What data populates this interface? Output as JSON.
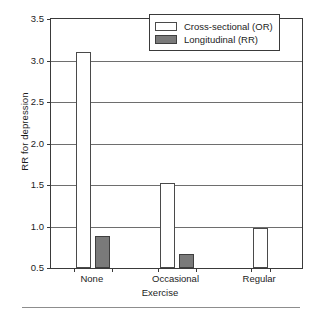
{
  "chart_data": {
    "type": "bar",
    "title": "",
    "subtitle": "",
    "xlabel": "Exercise",
    "ylabel": "RR for depression",
    "categories": [
      "None",
      "Occasional",
      "Regular"
    ],
    "ylim": [
      0.5,
      3.5
    ],
    "yticks": [
      "0.5",
      "1.0",
      "1.5",
      "2.0",
      "2.5",
      "3.0",
      "3.5"
    ],
    "ytick_values": [
      0.5,
      1.0,
      1.5,
      2.0,
      2.5,
      3.0,
      3.5
    ],
    "grid": "horizontal",
    "legend_position": "top-right",
    "series": [
      {
        "name": "Cross-sectional (OR)",
        "color": "#ffffff",
        "edge_color": "#4a4a4a",
        "values": [
          3.1,
          1.53,
          0.98
        ]
      },
      {
        "name": "Longitudinal (RR)",
        "color": "#7a7a7a",
        "edge_color": "#3f3f3f",
        "values": [
          0.88,
          0.67,
          null
        ]
      }
    ]
  },
  "legend": {
    "items": [
      {
        "label": "Cross-sectional (OR)",
        "swatch": "cross"
      },
      {
        "label": "Longitudinal (RR)",
        "swatch": "longi"
      }
    ]
  },
  "axes": {
    "y_title": "RR for depression",
    "x_title": "Exercise"
  },
  "colors": {
    "bar_cross_fill": "#ffffff",
    "bar_longitudinal_fill": "#7a7a7a",
    "frame": "#3a3a3a",
    "grid": "#6e6e6e",
    "text": "#1c1c1c"
  }
}
